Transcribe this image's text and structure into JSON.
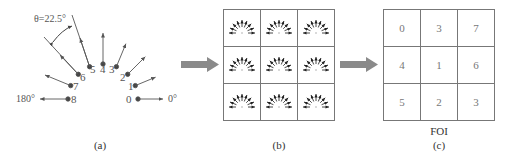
{
  "panel_a": {
    "caption": "(a)",
    "angle_label": "θ=22.5°",
    "left_label": "180°",
    "right_label": "0°",
    "direction_indices": [
      "0",
      "1",
      "2",
      "3",
      "4",
      "5",
      "6",
      "7",
      "8"
    ]
  },
  "panel_b": {
    "caption": "(b)",
    "grid_rows": 3,
    "grid_cols": 3
  },
  "panel_c": {
    "caption": "(c)",
    "title": "FOI",
    "cells": [
      [
        "0",
        "3",
        "7"
      ],
      [
        "4",
        "1",
        "6"
      ],
      [
        "5",
        "2",
        "3"
      ]
    ]
  },
  "colors": {
    "arrow_fill": "#8a8a8a",
    "line": "#555555",
    "grid_border": "#777777"
  }
}
